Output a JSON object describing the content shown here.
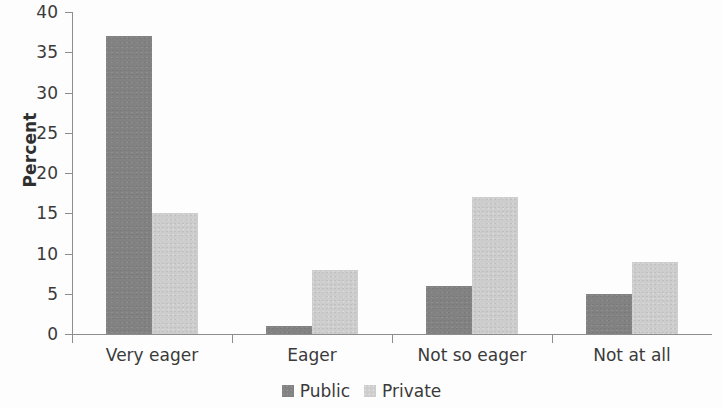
{
  "chart_data": {
    "type": "bar",
    "title": "",
    "xlabel": "",
    "ylabel": "Percent",
    "categories": [
      "Very eager",
      "Eager",
      "Not so eager",
      "Not at all"
    ],
    "series": [
      {
        "name": "Public",
        "color": "#828282",
        "values": [
          37,
          1,
          6,
          5
        ]
      },
      {
        "name": "Private",
        "color": "#cdcdcd",
        "values": [
          15,
          8,
          17,
          9
        ]
      }
    ],
    "ylim": [
      0,
      40
    ],
    "ytick_step": 5,
    "ytick_labels": [
      "0",
      "5",
      "10",
      "15",
      "20",
      "25",
      "30",
      "35",
      "40"
    ],
    "grid": false,
    "legend_position": "bottom-center"
  },
  "axes": {
    "y_title": "Percent"
  },
  "legend": {
    "items": [
      {
        "label": "Public"
      },
      {
        "label": "Private"
      }
    ]
  }
}
